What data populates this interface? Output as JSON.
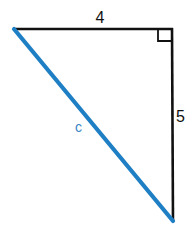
{
  "diagram": {
    "type": "right-triangle",
    "sides": {
      "top": {
        "label": "4",
        "color": "#111111"
      },
      "right": {
        "label": "5",
        "color": "#111111"
      },
      "hypotenuse": {
        "label": "c",
        "color": "#1f7fc4"
      }
    },
    "right_angle_marker": true,
    "vertices": {
      "top_left": [
        14,
        29
      ],
      "right_angle": [
        172,
        29
      ],
      "bottom": [
        173,
        221
      ]
    }
  }
}
